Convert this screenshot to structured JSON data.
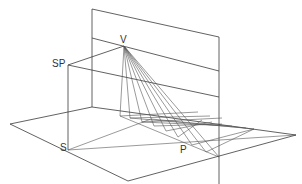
{
  "diagram": {
    "type": "perspective-construction",
    "labels": {
      "vanishing_point": "V",
      "station_point_elevation": "SP",
      "station_point_ground": "S",
      "point": "P"
    },
    "colors": {
      "line": "#3a3a3a",
      "background": "#ffffff"
    },
    "points": {
      "V": [
        124,
        46
      ],
      "SP": [
        68,
        65
      ],
      "S": [
        68,
        150
      ],
      "picture_plane_top_left": [
        92,
        9
      ],
      "picture_plane_top_right": [
        219,
        37
      ],
      "picture_plane_bottom_left": [
        92,
        107
      ],
      "picture_plane_bottom_right": [
        219,
        157
      ],
      "horizon_left": [
        92,
        38
      ],
      "horizon_right": [
        219,
        71
      ],
      "ground_left": [
        10,
        124
      ],
      "ground_front": [
        128,
        181
      ],
      "ground_right": [
        296,
        135
      ]
    }
  }
}
